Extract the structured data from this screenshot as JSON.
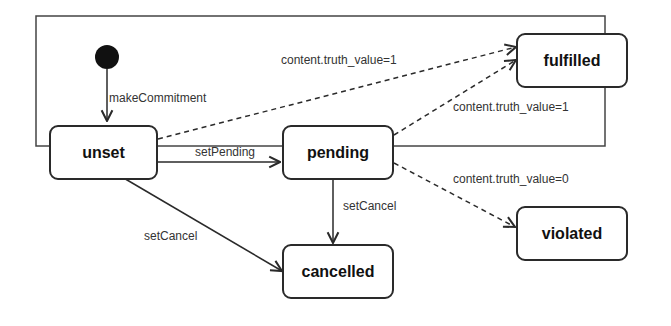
{
  "diagram": {
    "type": "state-machine",
    "states": [
      {
        "id": "unset",
        "label": "unset"
      },
      {
        "id": "pending",
        "label": "pending"
      },
      {
        "id": "cancelled",
        "label": "cancelled"
      },
      {
        "id": "fulfilled",
        "label": "fulfilled"
      },
      {
        "id": "violated",
        "label": "violated"
      }
    ],
    "transitions": [
      {
        "from": "initial",
        "to": "unset",
        "label": "makeCommitment",
        "style": "solid"
      },
      {
        "from": "unset",
        "to": "pending",
        "label": "setPending",
        "style": "solid"
      },
      {
        "from": "unset",
        "to": "cancelled",
        "label": "setCancel",
        "style": "solid"
      },
      {
        "from": "pending",
        "to": "cancelled",
        "label": "setCancel",
        "style": "solid"
      },
      {
        "from": "unset",
        "to": "fulfilled",
        "label": "content.truth_value=1",
        "style": "dashed"
      },
      {
        "from": "pending",
        "to": "fulfilled",
        "label": "content.truth_value=1",
        "style": "dashed"
      },
      {
        "from": "pending",
        "to": "violated",
        "label": "content.truth_value=0",
        "style": "dashed"
      }
    ]
  }
}
